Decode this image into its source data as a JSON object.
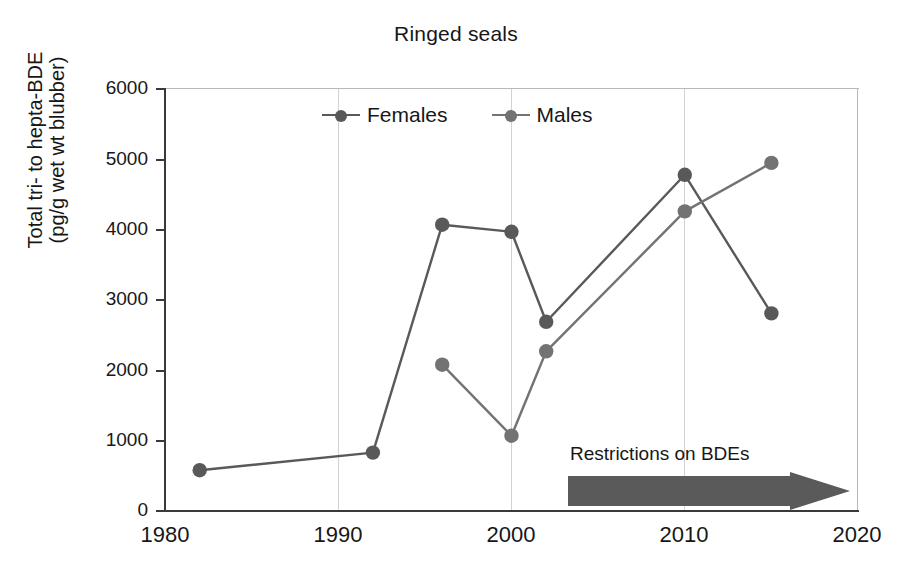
{
  "chart_data": {
    "type": "line",
    "title": "Ringed seals",
    "xlabel": "",
    "ylabel": "Total tri- to hepta-BDE (pg/g wet wt blubber)",
    "ylabel_lines": [
      "Total tri- to hepta-BDE",
      "(pg/g wet wt blubber)"
    ],
    "xlim": [
      1980,
      2020
    ],
    "ylim": [
      0,
      6000
    ],
    "xticks": [
      1980,
      1990,
      2000,
      2010,
      2020
    ],
    "yticks": [
      0,
      1000,
      2000,
      3000,
      4000,
      5000,
      6000
    ],
    "xtick_labels": [
      "1980",
      "1990",
      "2000",
      "2010",
      "2020"
    ],
    "ytick_labels": [
      "0",
      "1000",
      "2000",
      "3000",
      "4000",
      "5000",
      "6000"
    ],
    "grid": "vertical",
    "legend_position": "top-center",
    "series": [
      {
        "name": "Females",
        "color": "#595959",
        "x": [
          1982,
          1992,
          1996,
          2000,
          2002,
          2010,
          2015
        ],
        "values": [
          580,
          830,
          4070,
          3970,
          2690,
          4780,
          2810
        ]
      },
      {
        "name": "Males",
        "color": "#737373",
        "x": [
          1996,
          2000,
          2002,
          2010,
          2015
        ],
        "values": [
          2080,
          1070,
          2270,
          4260,
          4950
        ]
      }
    ],
    "annotations": [
      {
        "text": "Restrictions on BDEs",
        "shape": "right-arrow",
        "x_start": 2002,
        "x_end": 2018,
        "color": "#5a5a5a"
      }
    ]
  },
  "colors": {
    "females": "#595959",
    "males": "#737373",
    "axis": "#3a3a3a",
    "grid": "#d2d2d2",
    "arrow": "#5a5a5a",
    "text": "#171717",
    "background": "#ffffff"
  }
}
